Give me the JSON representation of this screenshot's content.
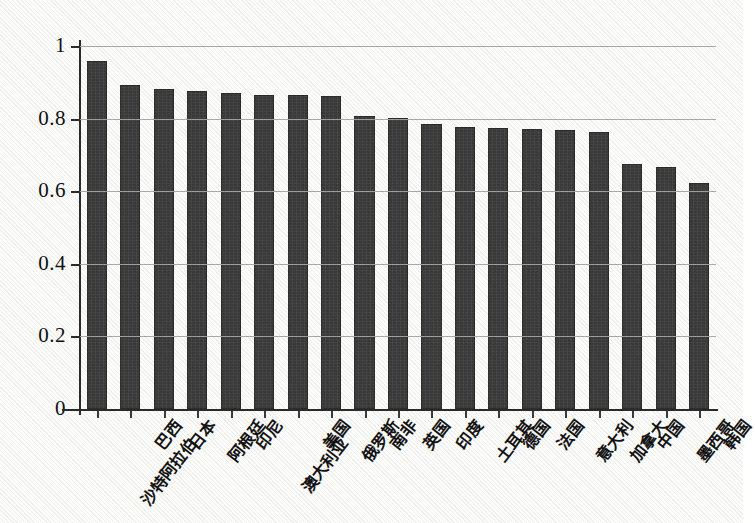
{
  "chart_data": {
    "type": "bar",
    "title": "",
    "subtitle": "",
    "xlabel": "",
    "ylabel": "",
    "ylim": [
      0,
      1
    ],
    "yticks": [
      "0",
      "0.2",
      "0.4",
      "0.6",
      "0.8",
      "1"
    ],
    "ytick_values": [
      0,
      0.2,
      0.4,
      0.6,
      0.8,
      1
    ],
    "grid": true,
    "legend": "none",
    "categories": [
      "沙特阿拉伯",
      "巴西",
      "日本",
      "阿根廷",
      "印尼",
      "澳大利亚",
      "美国",
      "俄罗斯",
      "南非",
      "英国",
      "印度",
      "土耳其",
      "德国",
      "法国",
      "意大利",
      "加拿大",
      "中国",
      "墨西哥",
      "韩国"
    ],
    "values": [
      0.958,
      0.892,
      0.881,
      0.876,
      0.87,
      0.866,
      0.864,
      0.863,
      0.807,
      0.803,
      0.784,
      0.778,
      0.775,
      0.771,
      0.768,
      0.764,
      0.674,
      0.668,
      0.624
    ]
  },
  "style": {
    "bar_color": "#3a3a3a",
    "grid_color": "#a6a6a6",
    "axis_color": "#2b2b2b",
    "background": "#fdfdfc",
    "text_color": "#131313"
  }
}
